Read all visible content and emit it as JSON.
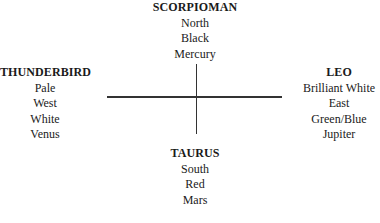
{
  "diagram": {
    "type": "cross-compass",
    "nodes": {
      "north": {
        "title": "SCORPIOMAN",
        "items": [
          "North",
          "Black",
          "Mercury"
        ]
      },
      "west": {
        "title": "THUNDERBIRD",
        "items": [
          "Pale",
          "West",
          "White",
          "Venus"
        ]
      },
      "east": {
        "title": "LEO",
        "items": [
          "Brilliant White",
          "East",
          "Green/Blue",
          "Jupiter"
        ]
      },
      "south": {
        "title": "TAURUS",
        "items": [
          "South",
          "Red",
          "Mars"
        ]
      }
    },
    "colors": {
      "text": "#1a1a1a",
      "lines": "#333333",
      "background": "#ffffff"
    }
  }
}
